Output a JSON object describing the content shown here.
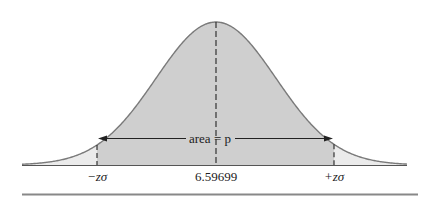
{
  "figure": {
    "type": "normal-distribution-diagram",
    "mean_label": "6.59699",
    "left_label": "−zσ",
    "right_label": "+zσ",
    "area_label": "area = p",
    "colors": {
      "center_fill": "#cfcfcf",
      "tail_fill": "#ebebeb",
      "curve": "#7a7a7a",
      "axis": "#555555",
      "dashes": "#333333",
      "bottom_rule": "#888888"
    }
  }
}
